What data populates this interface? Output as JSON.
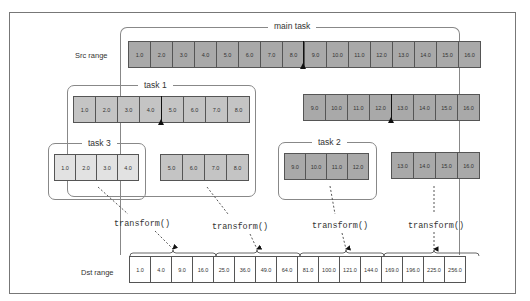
{
  "diagram": {
    "groups": {
      "main": {
        "label": "main task"
      },
      "task1": {
        "label": "task 1"
      },
      "task2": {
        "label": "task 2"
      },
      "task3": {
        "label": "task 3"
      }
    },
    "rows": {
      "src_label": "Src range",
      "dst_label": "Dst range"
    },
    "src": [
      "1.0",
      "2.0",
      "3.0",
      "4.0",
      "5.0",
      "6.0",
      "7.0",
      "8.0",
      "9.0",
      "10.0",
      "11.0",
      "12.0",
      "13.0",
      "14.0",
      "15.0",
      "16.0"
    ],
    "task1_cells": [
      "1.0",
      "2.0",
      "3.0",
      "4.0",
      "5.0",
      "6.0",
      "7.0",
      "8.0"
    ],
    "right_half_cells": [
      "9.0",
      "10.0",
      "11.0",
      "12.0",
      "13.0",
      "14.0",
      "15.0",
      "16.0"
    ],
    "task3_cells": [
      "1.0",
      "2.0",
      "3.0",
      "4.0"
    ],
    "task1_rest_cells": [
      "5.0",
      "6.0",
      "7.0",
      "8.0"
    ],
    "task2_cells": [
      "9.0",
      "10.0",
      "11.0",
      "12.0"
    ],
    "right_rest_cells": [
      "13.0",
      "14.0",
      "15.0",
      "16.0"
    ],
    "dst": [
      "1.0",
      "4.0",
      "9.0",
      "16.0",
      "25.0",
      "36.0",
      "49.0",
      "64.0",
      "81.0",
      "100.0",
      "121.0",
      "144.0",
      "169.0",
      "196.0",
      "225.0",
      "256.0"
    ],
    "transform_label": "transform()",
    "colors": {
      "dark_cell": "#a9a9a9",
      "mid_cell": "#c4c4c4",
      "light_cell": "#e2e2e2",
      "border": "#555555"
    }
  }
}
